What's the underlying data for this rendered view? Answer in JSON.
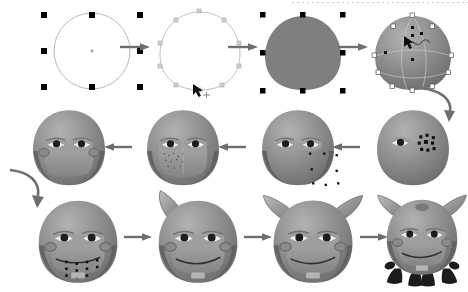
{
  "document": {
    "title": "Vector bull character creation steps",
    "type": "illustration-tutorial",
    "background_color": "#ffffff",
    "width": 468,
    "height": 292,
    "rows": 3,
    "steps_total": 12
  },
  "palette": {
    "body_mid": "#8a8a8a",
    "body_light": "#a8a8a8",
    "body_dark": "#6b6b6b",
    "body_darker": "#585858",
    "muzzle": "#9b9b9b",
    "muzzle_shadow": "#7d7d7d",
    "eye_white": "#f2f2f2",
    "pupil": "#1d1d1d",
    "horn_light": "#b4b4b4",
    "horn_dark": "#6e6e6e",
    "hoof": "#222222",
    "outline": "#b9b9b9",
    "handle": "#000000",
    "arrow": "#6e6e6e",
    "mesh_line": "#c8c8c8",
    "flat_fill": "#7f7f7f"
  },
  "steps": [
    {
      "id": 1,
      "name": "draw-circle",
      "label": "Circle drawn with eight selection handles and centre marker",
      "row": 1,
      "col": 1
    },
    {
      "id": 2,
      "name": "deform-path",
      "label": "Circle converted to an editable path and reshaped with node markers",
      "row": 1,
      "col": 2
    },
    {
      "id": 3,
      "name": "fill-flat-gray",
      "label": "Shape filled with flat gray, selection handles visible",
      "row": 1,
      "col": 3
    },
    {
      "id": 4,
      "name": "apply-gradient-mesh",
      "label": "Gradient mesh applied with mesh grid lines and square nodes",
      "row": 1,
      "col": 4
    },
    {
      "id": 5,
      "name": "create-eyes",
      "label": "First eye shaded, second eye being built from nodes",
      "row": 2,
      "col": 4
    },
    {
      "id": 6,
      "name": "add-cheek-shading",
      "label": "Both eyes complete and darker jaw shading added",
      "row": 2,
      "col": 3
    },
    {
      "id": 7,
      "name": "add-muzzle",
      "label": "Muzzle shape added across lower face with mesh texture",
      "row": 2,
      "col": 2
    },
    {
      "id": 8,
      "name": "add-ears",
      "label": "Ears with rings added to both sides of head",
      "row": 2,
      "col": 1
    },
    {
      "id": 9,
      "name": "draw-mouth",
      "label": "Mouth line drawn with editing nodes and teeth below",
      "row": 3,
      "col": 1
    },
    {
      "id": 10,
      "name": "add-first-horn",
      "label": "First curved horn added at upper left",
      "row": 3,
      "col": 2
    },
    {
      "id": 11,
      "name": "add-second-horn",
      "label": "Second horn added, full bull head complete",
      "row": 3,
      "col": 3
    },
    {
      "id": 12,
      "name": "add-legs-final",
      "label": "Dark hooves, arms and legs added to finish the bull",
      "row": 3,
      "col": 4
    }
  ],
  "arrows": [
    {
      "name": "arrow-step1-to-step2",
      "direction": "right"
    },
    {
      "name": "arrow-step2-to-step3",
      "direction": "right"
    },
    {
      "name": "arrow-step3-to-step4",
      "direction": "right"
    },
    {
      "name": "arrow-step4-to-step5",
      "direction": "curve-down"
    },
    {
      "name": "arrow-step5-to-step6",
      "direction": "left"
    },
    {
      "name": "arrow-step6-to-step7",
      "direction": "left"
    },
    {
      "name": "arrow-step7-to-step8",
      "direction": "left"
    },
    {
      "name": "arrow-step8-to-step9",
      "direction": "curve-down"
    },
    {
      "name": "arrow-step9-to-step10",
      "direction": "right"
    },
    {
      "name": "arrow-step10-to-step11",
      "direction": "right"
    },
    {
      "name": "arrow-step11-to-step12",
      "direction": "right"
    }
  ],
  "cursors": [
    {
      "name": "cursor-on-path-node",
      "step": 2
    },
    {
      "name": "cursor-on-mesh-node",
      "step": 4
    }
  ]
}
